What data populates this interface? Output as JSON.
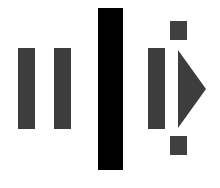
{
  "icon": {
    "description": "Pause | Play step-forward symbol composition",
    "colors": {
      "gray": "#3d3d3d",
      "black": "#000000",
      "background": "#ffffff"
    },
    "elements": [
      {
        "name": "pause-bar-left",
        "type": "rect",
        "x": 18,
        "y": 48,
        "w": 17,
        "h": 81
      },
      {
        "name": "pause-bar-right",
        "type": "rect",
        "x": 54,
        "y": 48,
        "w": 17,
        "h": 81
      },
      {
        "name": "divider-bar",
        "type": "rect",
        "x": 98,
        "y": 8,
        "w": 25,
        "h": 162
      },
      {
        "name": "step-bar",
        "type": "rect",
        "x": 148,
        "y": 48,
        "w": 17,
        "h": 81
      },
      {
        "name": "marker-top",
        "type": "rect",
        "x": 170,
        "y": 21,
        "w": 17,
        "h": 19
      },
      {
        "name": "marker-bottom",
        "type": "rect",
        "x": 170,
        "y": 136,
        "w": 17,
        "h": 19
      },
      {
        "name": "play-triangle",
        "type": "polygon",
        "points": "178,50 206,89 178,128"
      }
    ]
  }
}
